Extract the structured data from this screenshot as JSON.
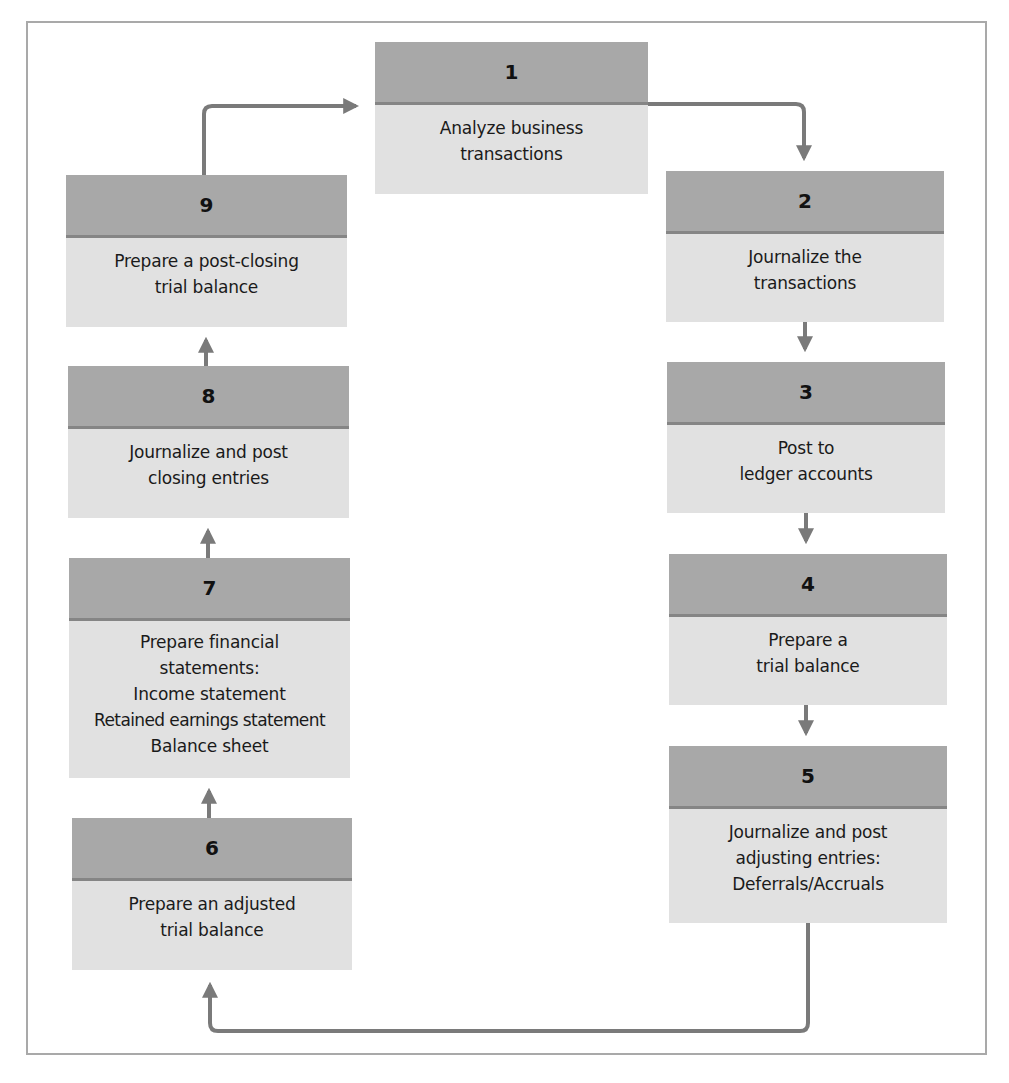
{
  "diagram": {
    "colors": {
      "header": "#a8a8a8",
      "body": "#e1e1e1",
      "divider": "#858585",
      "arrow": "#7a7a7a",
      "frame": "#a9a9a9"
    },
    "steps": [
      {
        "number": "1",
        "lines": [
          "Analyze business",
          "transactions"
        ]
      },
      {
        "number": "2",
        "lines": [
          "Journalize the",
          "transactions"
        ]
      },
      {
        "number": "3",
        "lines": [
          "Post to",
          "ledger accounts"
        ]
      },
      {
        "number": "4",
        "lines": [
          "Prepare a",
          "trial balance"
        ]
      },
      {
        "number": "5",
        "lines": [
          "Journalize and post",
          "adjusting entries:",
          "Deferrals/Accruals"
        ]
      },
      {
        "number": "6",
        "lines": [
          "Prepare an adjusted",
          "trial balance"
        ]
      },
      {
        "number": "7",
        "lines": [
          "Prepare financial",
          "statements:",
          "Income statement",
          "Retained earnings statement",
          "Balance sheet"
        ]
      },
      {
        "number": "8",
        "lines": [
          "Journalize and post",
          "closing entries"
        ]
      },
      {
        "number": "9",
        "lines": [
          "Prepare a post-closing",
          "trial balance"
        ]
      }
    ],
    "flow": [
      {
        "from": "1",
        "to": "2"
      },
      {
        "from": "2",
        "to": "3"
      },
      {
        "from": "3",
        "to": "4"
      },
      {
        "from": "4",
        "to": "5"
      },
      {
        "from": "5",
        "to": "6"
      },
      {
        "from": "6",
        "to": "7"
      },
      {
        "from": "7",
        "to": "8"
      },
      {
        "from": "8",
        "to": "9"
      },
      {
        "from": "9",
        "to": "1"
      }
    ]
  }
}
